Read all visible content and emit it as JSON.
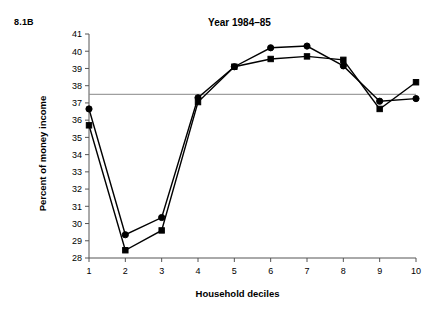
{
  "figure": {
    "label": "8.1B",
    "title": "Year 1984–85"
  },
  "axes": {
    "xlabel": "Household deciles",
    "ylabel": "Percent of money income",
    "yticks": [
      "41",
      "40",
      "39",
      "38",
      "37",
      "36",
      "35",
      "34",
      "33",
      "32",
      "31",
      "30",
      "29",
      "28"
    ],
    "xticks": [
      "1",
      "2",
      "3",
      "4",
      "5",
      "6",
      "7",
      "8",
      "9",
      "10"
    ]
  },
  "chart_data": {
    "type": "line",
    "title": "Year 1984–85",
    "xlabel": "Household deciles",
    "ylabel": "Percent of money income",
    "x": [
      1,
      2,
      3,
      4,
      5,
      6,
      7,
      8,
      9,
      10
    ],
    "categories": [
      "1",
      "2",
      "3",
      "4",
      "5",
      "6",
      "7",
      "8",
      "9",
      "10"
    ],
    "xlim": [
      1,
      10
    ],
    "ylim": [
      28,
      41
    ],
    "ytick_values": [
      28,
      29,
      30,
      31,
      32,
      33,
      34,
      35,
      36,
      37,
      38,
      39,
      40,
      41
    ],
    "grid": false,
    "legend": "none",
    "series": [
      {
        "name": "circle-series",
        "marker": "circle",
        "values": [
          36.65,
          29.35,
          30.35,
          37.3,
          39.1,
          40.2,
          40.3,
          39.15,
          37.1,
          37.25
        ]
      },
      {
        "name": "square-series",
        "marker": "square",
        "values": [
          35.7,
          28.45,
          29.6,
          37.05,
          39.1,
          39.55,
          39.7,
          39.5,
          36.65,
          38.2
        ]
      }
    ],
    "annotations": [
      {
        "type": "hline",
        "value": 37.5,
        "label": "",
        "color": "#888888"
      }
    ]
  },
  "colors": {
    "line": "#000000",
    "axis": "#555555",
    "reference_line": "#888888",
    "background": "#ffffff"
  }
}
